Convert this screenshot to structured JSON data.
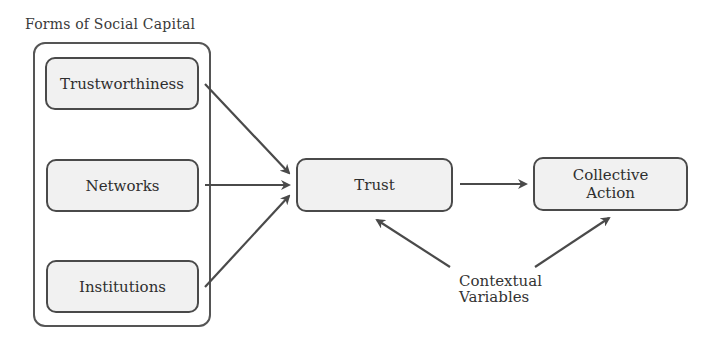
{
  "diagram": {
    "group": {
      "title": "Forms of Social Capital",
      "items": [
        {
          "id": "trustworthiness",
          "label": "Trustworthiness"
        },
        {
          "id": "networks",
          "label": "Networks"
        },
        {
          "id": "institutions",
          "label": "Institutions"
        }
      ]
    },
    "nodes": {
      "trust": {
        "label": "Trust"
      },
      "collective_action": {
        "label_line1": "Collective",
        "label_line2": "Action"
      }
    },
    "context_label": {
      "line1": "Contextual",
      "line2": "Variables"
    },
    "edges": [
      {
        "from": "trustworthiness",
        "to": "trust"
      },
      {
        "from": "networks",
        "to": "trust"
      },
      {
        "from": "institutions",
        "to": "trust"
      },
      {
        "from": "trust",
        "to": "collective_action"
      },
      {
        "from": "contextual_variables",
        "to": "trust"
      },
      {
        "from": "contextual_variables",
        "to": "collective_action"
      }
    ],
    "colors": {
      "stroke": "#4a4a4a",
      "node_fill": "#f1f1f1"
    }
  }
}
